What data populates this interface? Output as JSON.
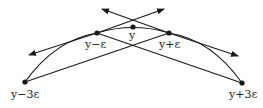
{
  "diagram": {
    "stroke_color": "#1a1a1a",
    "background": "#ffffff",
    "points": [
      {
        "id": "p_m3",
        "label": "y−3ε",
        "x": 25,
        "y": 82
      },
      {
        "id": "p_m1",
        "label": "y−ε",
        "x": 97,
        "y": 33
      },
      {
        "id": "p_0",
        "label": "y",
        "x": 133,
        "y": 27
      },
      {
        "id": "p_p1",
        "label": "y+ε",
        "x": 169,
        "y": 33
      },
      {
        "id": "p_p3",
        "label": "y+3ε",
        "x": 242,
        "y": 83
      }
    ],
    "labels": {
      "y_minus_3eps": "y−3ε",
      "y_minus_eps": "y−ε",
      "y": "y",
      "y_plus_eps": "y+ε",
      "y_plus_3eps": "y+3ε"
    },
    "lines": [
      {
        "name": "secant-left-to-right-plus-eps",
        "from": "p_m3",
        "to": "p_p1"
      },
      {
        "name": "secant-minus-eps-to-right",
        "from": "p_m1",
        "to": "p_p3"
      },
      {
        "name": "tangent-arrow-left",
        "type": "double-arrow",
        "tips": [
          [
            29,
            55
          ],
          [
            164,
            9
          ]
        ]
      },
      {
        "name": "tangent-arrow-right",
        "type": "double-arrow",
        "tips": [
          [
            102,
            9
          ],
          [
            238,
            56
          ]
        ]
      }
    ]
  }
}
